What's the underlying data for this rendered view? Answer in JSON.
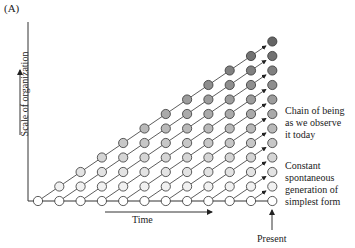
{
  "panel_label": "(A)",
  "axes": {
    "y_label": "Scale of organization",
    "x_label": "Time",
    "present_label": "Present"
  },
  "annotations": {
    "chain_of_being": [
      "Chain of being",
      "as we observe",
      "it today"
    ],
    "constant_generation": [
      "Constant",
      "spontaneous",
      "generation of",
      "simplest form"
    ]
  },
  "grid": {
    "columns": 12,
    "origin_x": 38,
    "origin_y": 201,
    "dx": 21.3,
    "dy": 14.5,
    "radius": 4.6
  },
  "colors": {
    "line": "#333333",
    "fill_light": "#ffffff",
    "fill_dark": "#6a6a6a"
  }
}
